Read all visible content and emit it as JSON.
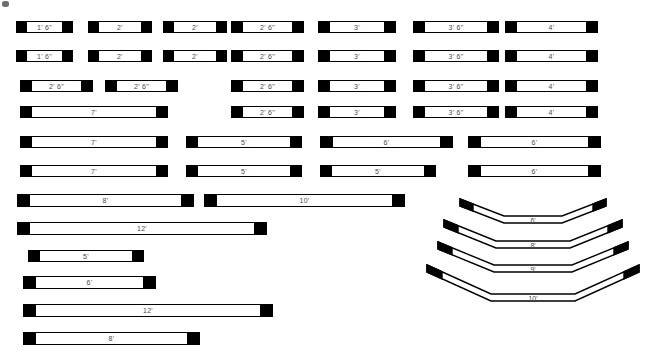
{
  "sheet": {
    "title": "Dimension Bar Size Chart",
    "width": 652,
    "height": 360,
    "background": "#ffffff",
    "ink": "#000000",
    "label_color": "#4a4a4a"
  },
  "artifact": {
    "name": "scan-speck",
    "x": 2,
    "y": 1,
    "w": 7,
    "h": 6
  },
  "legend": {
    "units_note": "feet and inches",
    "foot_symbol": "'",
    "inch_symbol": "\""
  },
  "straight_bars": [
    {
      "label": "1' 6\"",
      "x": 16,
      "y": 21,
      "w": 57,
      "h": 12,
      "cap": 10,
      "fs": 7
    },
    {
      "label": "2'",
      "x": 88,
      "y": 21,
      "w": 64,
      "h": 12,
      "cap": 10,
      "fs": 7
    },
    {
      "label": "2'",
      "x": 163,
      "y": 21,
      "w": 64,
      "h": 12,
      "cap": 10,
      "fs": 7
    },
    {
      "label": "2' 6\"",
      "x": 231,
      "y": 21,
      "w": 73,
      "h": 12,
      "cap": 11,
      "fs": 7
    },
    {
      "label": "3'",
      "x": 318,
      "y": 21,
      "w": 78,
      "h": 12,
      "cap": 11,
      "fs": 7
    },
    {
      "label": "3' 6\"",
      "x": 413,
      "y": 21,
      "w": 86,
      "h": 12,
      "cap": 11,
      "fs": 7
    },
    {
      "label": "4'",
      "x": 505,
      "y": 21,
      "w": 93,
      "h": 12,
      "cap": 11,
      "fs": 7
    },
    {
      "label": "1' 6\"",
      "x": 16,
      "y": 50,
      "w": 57,
      "h": 12,
      "cap": 10,
      "fs": 7
    },
    {
      "label": "2'",
      "x": 88,
      "y": 50,
      "w": 64,
      "h": 12,
      "cap": 10,
      "fs": 7
    },
    {
      "label": "2'",
      "x": 163,
      "y": 50,
      "w": 64,
      "h": 12,
      "cap": 10,
      "fs": 7
    },
    {
      "label": "2' 6\"",
      "x": 231,
      "y": 50,
      "w": 73,
      "h": 12,
      "cap": 11,
      "fs": 7
    },
    {
      "label": "3'",
      "x": 318,
      "y": 50,
      "w": 78,
      "h": 12,
      "cap": 11,
      "fs": 7
    },
    {
      "label": "3' 6\"",
      "x": 413,
      "y": 50,
      "w": 86,
      "h": 12,
      "cap": 11,
      "fs": 7
    },
    {
      "label": "4'",
      "x": 505,
      "y": 50,
      "w": 93,
      "h": 12,
      "cap": 11,
      "fs": 7
    },
    {
      "label": "2' 6\"",
      "x": 20,
      "y": 80,
      "w": 73,
      "h": 12,
      "cap": 11,
      "fs": 7
    },
    {
      "label": "2' 6\"",
      "x": 105,
      "y": 80,
      "w": 73,
      "h": 12,
      "cap": 11,
      "fs": 7
    },
    {
      "label": "2' 6\"",
      "x": 231,
      "y": 80,
      "w": 73,
      "h": 12,
      "cap": 11,
      "fs": 7
    },
    {
      "label": "3'",
      "x": 318,
      "y": 80,
      "w": 78,
      "h": 12,
      "cap": 11,
      "fs": 7
    },
    {
      "label": "3' 6\"",
      "x": 413,
      "y": 80,
      "w": 86,
      "h": 12,
      "cap": 11,
      "fs": 7
    },
    {
      "label": "4'",
      "x": 505,
      "y": 80,
      "w": 93,
      "h": 12,
      "cap": 11,
      "fs": 7
    },
    {
      "label": "7'",
      "x": 20,
      "y": 106,
      "w": 148,
      "h": 12,
      "cap": 11,
      "fs": 7
    },
    {
      "label": "2' 6\"",
      "x": 231,
      "y": 106,
      "w": 73,
      "h": 12,
      "cap": 11,
      "fs": 7
    },
    {
      "label": "3'",
      "x": 318,
      "y": 106,
      "w": 78,
      "h": 12,
      "cap": 11,
      "fs": 7
    },
    {
      "label": "3' 6\"",
      "x": 413,
      "y": 106,
      "w": 86,
      "h": 12,
      "cap": 11,
      "fs": 7
    },
    {
      "label": "4'",
      "x": 505,
      "y": 106,
      "w": 93,
      "h": 12,
      "cap": 11,
      "fs": 7
    },
    {
      "label": "7'",
      "x": 20,
      "y": 136,
      "w": 148,
      "h": 12,
      "cap": 11,
      "fs": 7
    },
    {
      "label": "5'",
      "x": 186,
      "y": 136,
      "w": 116,
      "h": 12,
      "cap": 11,
      "fs": 7
    },
    {
      "label": "6'",
      "x": 320,
      "y": 136,
      "w": 133,
      "h": 12,
      "cap": 12,
      "fs": 7
    },
    {
      "label": "6'",
      "x": 468,
      "y": 136,
      "w": 133,
      "h": 12,
      "cap": 12,
      "fs": 7
    },
    {
      "label": "7'",
      "x": 20,
      "y": 165,
      "w": 148,
      "h": 12,
      "cap": 11,
      "fs": 7
    },
    {
      "label": "5'",
      "x": 186,
      "y": 165,
      "w": 116,
      "h": 12,
      "cap": 11,
      "fs": 7
    },
    {
      "label": "5'",
      "x": 320,
      "y": 165,
      "w": 116,
      "h": 12,
      "cap": 11,
      "fs": 7
    },
    {
      "label": "6'",
      "x": 468,
      "y": 165,
      "w": 133,
      "h": 12,
      "cap": 12,
      "fs": 7
    },
    {
      "label": "8'",
      "x": 17,
      "y": 194,
      "w": 177,
      "h": 13,
      "cap": 12,
      "fs": 7
    },
    {
      "label": "10'",
      "x": 204,
      "y": 194,
      "w": 201,
      "h": 13,
      "cap": 12,
      "fs": 7
    },
    {
      "label": "12'",
      "x": 17,
      "y": 222,
      "w": 250,
      "h": 13,
      "cap": 12,
      "fs": 7
    },
    {
      "label": "5'",
      "x": 28,
      "y": 250,
      "w": 116,
      "h": 12,
      "cap": 11,
      "fs": 7
    },
    {
      "label": "6'",
      "x": 23,
      "y": 276,
      "w": 133,
      "h": 13,
      "cap": 12,
      "fs": 7
    },
    {
      "label": "12'",
      "x": 23,
      "y": 304,
      "w": 250,
      "h": 13,
      "cap": 12,
      "fs": 7
    },
    {
      "label": "8'",
      "x": 23,
      "y": 332,
      "w": 177,
      "h": 13,
      "cap": 12,
      "fs": 7
    }
  ],
  "bent_bars": [
    {
      "label": "6'",
      "x": 460,
      "y": 198,
      "w": 146,
      "h": 24,
      "cap": 13,
      "thickness": 7,
      "drop": 17,
      "flat_inset": 44,
      "fs": 7
    },
    {
      "label": "8'",
      "x": 444,
      "y": 219,
      "w": 178,
      "h": 28,
      "cap": 14,
      "thickness": 7,
      "drop": 21,
      "flat_inset": 52,
      "fs": 7
    },
    {
      "label": "9'",
      "x": 438,
      "y": 241,
      "w": 190,
      "h": 30,
      "cap": 14,
      "thickness": 7,
      "drop": 23,
      "flat_inset": 56,
      "fs": 7
    },
    {
      "label": "10'",
      "x": 427,
      "y": 264,
      "w": 212,
      "h": 36,
      "cap": 15,
      "thickness": 7,
      "drop": 29,
      "flat_inset": 64,
      "fs": 7
    }
  ]
}
